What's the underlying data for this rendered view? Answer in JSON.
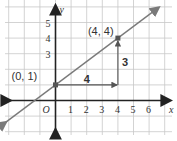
{
  "diagram": {
    "type": "coordinate-graph",
    "x_axis_label": "x",
    "y_axis_label": "y",
    "origin_label": "O",
    "x_ticks": [
      "1",
      "2",
      "3",
      "4",
      "5",
      "6"
    ],
    "y_ticks": [
      "3",
      "4",
      "5"
    ],
    "x_range": [
      -3.5,
      7
    ],
    "y_range": [
      -1.5,
      6.2
    ],
    "line": {
      "slope": 0.75,
      "intercept": 1,
      "color": "#7a7a7a"
    },
    "points": [
      {
        "label": "(0, 1)",
        "x": 0,
        "y": 1
      },
      {
        "label": "(4, 4)",
        "x": 4,
        "y": 4
      }
    ],
    "run": {
      "label": "4",
      "value": 4
    },
    "rise": {
      "label": "3",
      "value": 3
    },
    "colors": {
      "grid": "#c8c8c8",
      "axis": "#222222",
      "line": "#7a7a7a",
      "marker": "#555555"
    }
  }
}
